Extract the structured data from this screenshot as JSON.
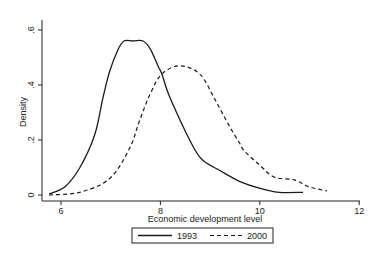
{
  "chart_data": {
    "type": "line",
    "title": "",
    "xlabel": "Economic development level",
    "ylabel": "Density",
    "xlim": [
      5.6,
      12.0
    ],
    "ylim": [
      0,
      0.6
    ],
    "xticks": [
      6,
      8,
      10,
      12
    ],
    "xtick_labels": [
      "6",
      "8",
      "10",
      "12"
    ],
    "yticks": [
      0,
      0.2,
      0.4,
      0.6
    ],
    "ytick_labels": [
      "0",
      ".2",
      ".4",
      ".6"
    ],
    "grid": false,
    "legend_position": "bottom",
    "series": [
      {
        "name": "1993",
        "style": "solid",
        "x": [
          5.76,
          6.08,
          6.38,
          6.68,
          6.84,
          6.98,
          7.15,
          7.27,
          7.45,
          7.65,
          7.8,
          7.95,
          8.03,
          8.18,
          8.59,
          8.83,
          9.19,
          9.59,
          9.99,
          10.39,
          10.87
        ],
        "y": [
          0.004,
          0.03,
          0.1,
          0.22,
          0.35,
          0.45,
          0.53,
          0.56,
          0.56,
          0.56,
          0.53,
          0.47,
          0.44,
          0.36,
          0.2,
          0.13,
          0.09,
          0.05,
          0.025,
          0.01,
          0.01
        ]
      },
      {
        "name": "2000",
        "style": "dashed",
        "x": [
          5.76,
          6.38,
          6.98,
          7.38,
          7.58,
          7.8,
          8.03,
          8.39,
          8.79,
          9.09,
          9.39,
          9.59,
          9.69,
          9.99,
          10.29,
          10.69,
          10.99,
          11.35
        ],
        "y": [
          0.0,
          0.01,
          0.06,
          0.17,
          0.27,
          0.37,
          0.44,
          0.47,
          0.44,
          0.35,
          0.25,
          0.19,
          0.16,
          0.11,
          0.065,
          0.055,
          0.03,
          0.015
        ]
      }
    ]
  }
}
